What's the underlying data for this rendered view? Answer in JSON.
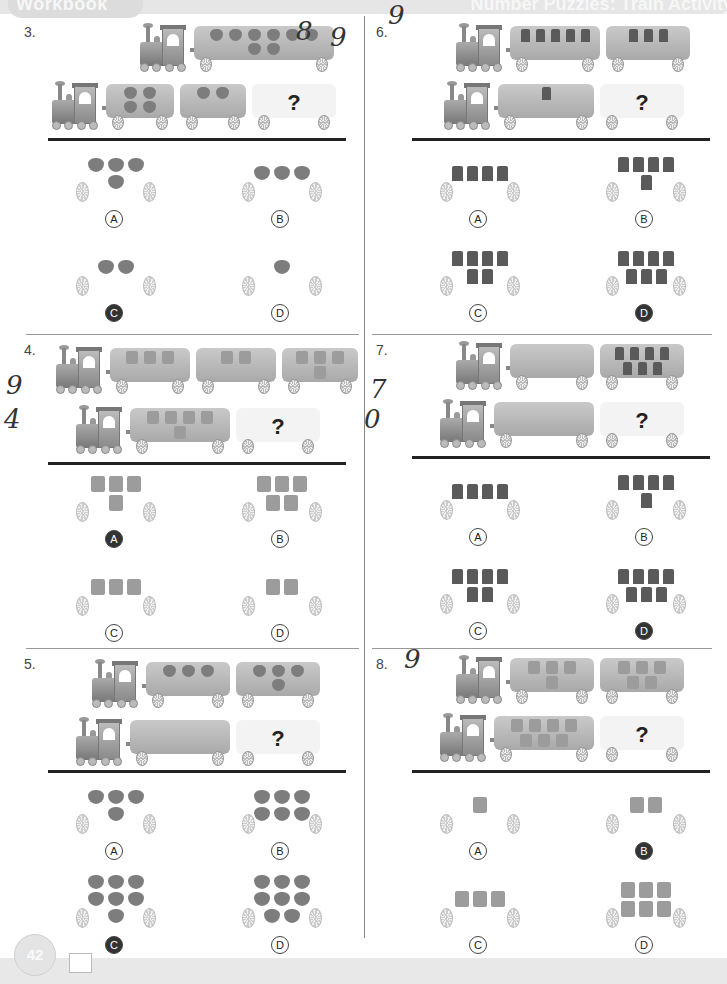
{
  "header": {
    "left_title": "Workbook",
    "right_title": "Number Puzzles: Train Activity"
  },
  "footer": {
    "page_number": "42"
  },
  "question_mark": "?",
  "problems": [
    {
      "number": "3.",
      "handwriting": [
        "8",
        "9"
      ],
      "top_train": {
        "cars": [
          {
            "item": "strawberry",
            "count": 8
          }
        ]
      },
      "bottom_train": {
        "cars": [
          {
            "item": "strawberry",
            "count": 4
          },
          {
            "item": "strawberry",
            "count": 2
          }
        ]
      },
      "choices": [
        {
          "label": "A",
          "item": "strawberry",
          "count": 4,
          "marked": false
        },
        {
          "label": "B",
          "item": "strawberry",
          "count": 3,
          "marked": false
        },
        {
          "label": "C",
          "item": "strawberry",
          "count": 2,
          "marked": true
        },
        {
          "label": "D",
          "item": "strawberry",
          "count": 1,
          "marked": false
        }
      ]
    },
    {
      "number": "6.",
      "handwriting": [
        "9"
      ],
      "top_train": {
        "cars": [
          {
            "item": "present-dark",
            "count": 5
          },
          {
            "item": "present-dark",
            "count": 3
          }
        ]
      },
      "bottom_train": {
        "cars": [
          {
            "item": "present-dark",
            "count": 1
          }
        ]
      },
      "choices": [
        {
          "label": "A",
          "item": "present-dark",
          "count": 4,
          "marked": false
        },
        {
          "label": "B",
          "item": "present-dark",
          "count": 5,
          "marked": false
        },
        {
          "label": "C",
          "item": "present-dark",
          "count": 6,
          "marked": false
        },
        {
          "label": "D",
          "item": "present-dark",
          "count": 7,
          "marked": true
        }
      ]
    },
    {
      "number": "4.",
      "handwriting": [
        "9",
        "4"
      ],
      "top_train": {
        "cars": [
          {
            "item": "present-light",
            "count": 3
          },
          {
            "item": "present-light",
            "count": 2
          },
          {
            "item": "present-light",
            "count": 4
          }
        ]
      },
      "bottom_train": {
        "cars": [
          {
            "item": "present-light",
            "count": 5
          }
        ]
      },
      "choices": [
        {
          "label": "A",
          "item": "present-light",
          "count": 4,
          "marked": true
        },
        {
          "label": "B",
          "item": "present-light",
          "count": 5,
          "marked": false
        },
        {
          "label": "C",
          "item": "present-light",
          "count": 3,
          "marked": false
        },
        {
          "label": "D",
          "item": "present-light",
          "count": 2,
          "marked": false
        }
      ]
    },
    {
      "number": "7.",
      "handwriting": [
        "7",
        "0"
      ],
      "top_train": {
        "cars": [
          {
            "item": "present-dark",
            "count": 0
          },
          {
            "item": "present-dark",
            "count": 7
          }
        ]
      },
      "bottom_train": {
        "cars": [
          {
            "item": "present-dark",
            "count": 0
          }
        ]
      },
      "choices": [
        {
          "label": "A",
          "item": "present-dark",
          "count": 4,
          "marked": false
        },
        {
          "label": "B",
          "item": "present-dark",
          "count": 5,
          "marked": false
        },
        {
          "label": "C",
          "item": "present-dark",
          "count": 6,
          "marked": false
        },
        {
          "label": "D",
          "item": "present-dark",
          "count": 7,
          "marked": true
        }
      ]
    },
    {
      "number": "5.",
      "handwriting": [],
      "top_train": {
        "cars": [
          {
            "item": "strawberry",
            "count": 3
          },
          {
            "item": "strawberry",
            "count": 4
          }
        ]
      },
      "bottom_train": {
        "cars": [
          {
            "item": "strawberry",
            "count": 0
          }
        ]
      },
      "choices": [
        {
          "label": "A",
          "item": "strawberry",
          "count": 4,
          "marked": false
        },
        {
          "label": "B",
          "item": "strawberry",
          "count": 6,
          "marked": false
        },
        {
          "label": "C",
          "item": "strawberry",
          "count": 7,
          "marked": true
        },
        {
          "label": "D",
          "item": "strawberry",
          "count": 8,
          "marked": false
        }
      ]
    },
    {
      "number": "8.",
      "handwriting": [
        "9"
      ],
      "top_train": {
        "cars": [
          {
            "item": "present-light",
            "count": 4
          },
          {
            "item": "present-light",
            "count": 5
          }
        ]
      },
      "bottom_train": {
        "cars": [
          {
            "item": "present-light",
            "count": 7
          }
        ]
      },
      "choices": [
        {
          "label": "A",
          "item": "present-light",
          "count": 1,
          "marked": false
        },
        {
          "label": "B",
          "item": "present-light",
          "count": 2,
          "marked": true
        },
        {
          "label": "C",
          "item": "present-light",
          "count": 3,
          "marked": false
        },
        {
          "label": "D",
          "item": "present-light",
          "count": 6,
          "marked": false
        }
      ]
    }
  ]
}
